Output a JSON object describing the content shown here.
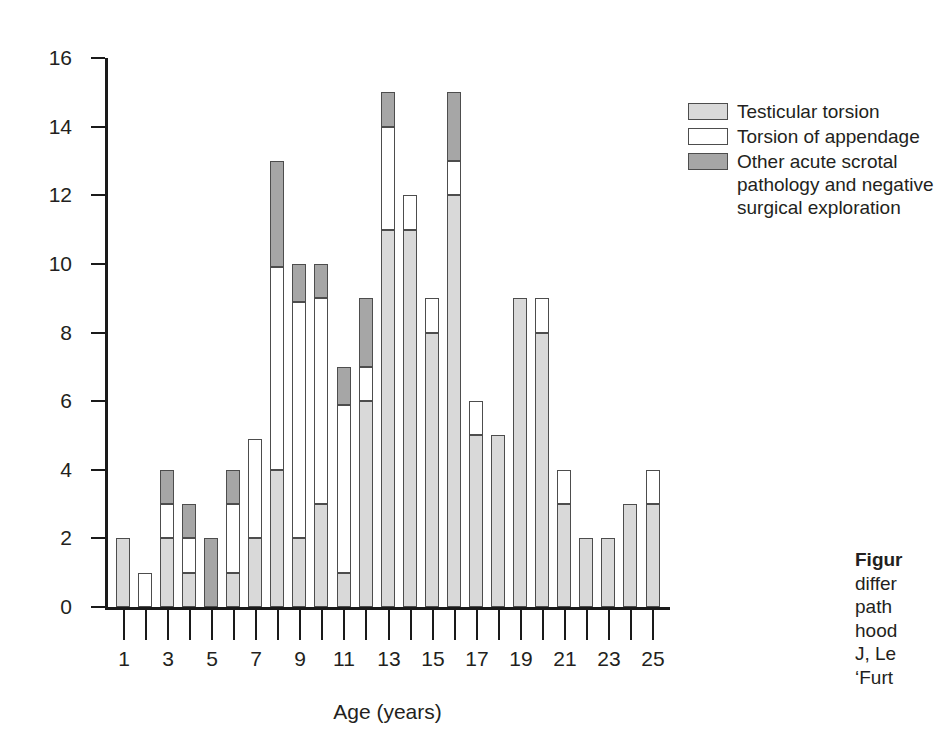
{
  "chart_data": {
    "type": "bar",
    "subtype": "stacked-bar",
    "title": "",
    "xlabel": "Age (years)",
    "ylabel": "",
    "ylim": [
      0,
      16
    ],
    "ytick_step": 2,
    "yticks": [
      "16",
      "14",
      "12",
      "10",
      "8",
      "6",
      "4",
      "2",
      "0"
    ],
    "grid": false,
    "legend_position": "top-right",
    "categories": [
      "1",
      "2",
      "3",
      "4",
      "5",
      "6",
      "7",
      "8",
      "9",
      "10",
      "11",
      "12",
      "13",
      "14",
      "15",
      "16",
      "17",
      "18",
      "19",
      "20",
      "21",
      "22",
      "23",
      "24",
      "25"
    ],
    "xtick_labels_shown": [
      "1",
      "3",
      "5",
      "7",
      "9",
      "11",
      "13",
      "15",
      "17",
      "19",
      "21",
      "23",
      "25"
    ],
    "series": [
      {
        "name": "Testicular torsion",
        "color": "#d9d9d9",
        "values": [
          2,
          0,
          2,
          1,
          0,
          1,
          2,
          4,
          2,
          3,
          1,
          6,
          11,
          11,
          8,
          12,
          5,
          5,
          9,
          8,
          3,
          2,
          2,
          3,
          3
        ]
      },
      {
        "name": "Torsion of appendage",
        "color": "#ffffff",
        "values": [
          0,
          1,
          1,
          1,
          0,
          2,
          2.9,
          5.9,
          6.9,
          6,
          4.9,
          1,
          3,
          1,
          1,
          1,
          1,
          0,
          0,
          1,
          1,
          0,
          0,
          0,
          1
        ]
      },
      {
        "name": "Other acute scrotal pathology and negative surgical exploration",
        "color": "#a6a6a6",
        "values": [
          0,
          0,
          1,
          1,
          2,
          1,
          0,
          3.1,
          1.1,
          1,
          1.1,
          2,
          1,
          0,
          0,
          2,
          0,
          0,
          0,
          0,
          0,
          0,
          0,
          0,
          0
        ]
      }
    ],
    "totals": [
      2,
      1,
      4,
      3,
      2,
      4,
      4.9,
      13,
      10,
      10,
      7,
      9,
      15,
      12,
      9,
      15,
      6,
      5,
      9,
      9,
      4,
      2,
      2,
      3,
      4
    ]
  },
  "legend": {
    "items": [
      {
        "label": "Testicular torsion",
        "swatch": "s0"
      },
      {
        "label": "Torsion of appendage",
        "swatch": "s1"
      },
      {
        "label": "Other acute scrotal",
        "swatch": "s2"
      }
    ],
    "wrap_line_2": "pathology and negative",
    "wrap_line_3": "surgical exploration"
  },
  "caption": {
    "line1_lead": "Figur",
    "line2": "differ",
    "line3": "path",
    "line4": "hood",
    "line5": "J, Le",
    "line6": "‘Furt"
  }
}
